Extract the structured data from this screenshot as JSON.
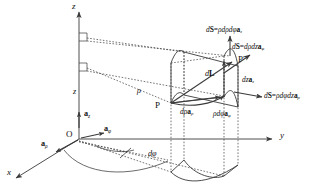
{
  "figure": {
    "kind": "cylindrical-coordinates-differential-element",
    "axes": {
      "x": "x",
      "y": "y",
      "z": "z",
      "origin": "O"
    },
    "unit_vectors": {
      "a_rho": {
        "a": "a",
        "sub": "ρ"
      },
      "a_phi": {
        "a": "a",
        "sub": "φ"
      },
      "a_z": {
        "a": "a",
        "sub": "z"
      }
    },
    "coordinate_labels": {
      "rho": "ρ",
      "z": "z",
      "dphi": "dφ"
    },
    "points": {
      "p": "P",
      "p_prime": "P′"
    },
    "surface_vectors": [
      {
        "id": "dS-z",
        "lhs_d": "d",
        "lhs_S": "S",
        "eq": "=",
        "scalar": "ρdρdφ",
        "vec": "a",
        "sub": "z",
        "full": "dS = ρdρdφ a_z"
      },
      {
        "id": "dS-phi",
        "lhs_d": "d",
        "lhs_S": "S",
        "eq": "=",
        "scalar": "dρdz",
        "vec": "a",
        "sub": "φ",
        "full": "dS = dρdz a_φ"
      },
      {
        "id": "dS-rho",
        "lhs_d": "d",
        "lhs_S": "S",
        "eq": "=",
        "scalar": "ρdφdz",
        "vec": "a",
        "sub": "ρ",
        "full": "dS = ρdφdz a_ρ"
      }
    ],
    "edge_vectors": [
      {
        "id": "d-rho",
        "scalar": "dρ",
        "vec": "a",
        "sub": "ρ",
        "full": "dρ a_ρ"
      },
      {
        "id": "rho-dphi",
        "scalar": "ρdφ",
        "vec": "a",
        "sub": "φ",
        "full": "ρdφ a_φ"
      },
      {
        "id": "dz",
        "scalar": "dz",
        "vec": "a",
        "sub": "z",
        "full": "dz a_z"
      }
    ],
    "differential_length": {
      "lhs_d": "d",
      "lhs_L": "L",
      "full": "dL"
    },
    "colors": {
      "stroke": "#3a3a3a",
      "text": "#111111",
      "background": "#ffffff"
    }
  }
}
